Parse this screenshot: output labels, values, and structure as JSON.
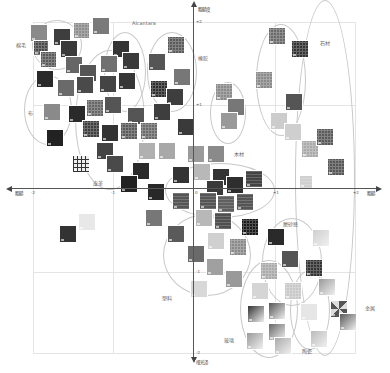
{
  "figure": {
    "title_label": "Alcantara",
    "axes": {
      "x_left_label": "粗糙",
      "x_right_label": "粗糙",
      "y_top_label": "粗糙度",
      "y_bottom_label": "哑光泽",
      "x_ticks": [
        "-2",
        "-1",
        "0",
        "+1",
        "+2"
      ],
      "y_ticks": [
        "+2",
        "+1",
        "-1",
        "-2"
      ]
    },
    "categories": [
      {
        "name": "棉毛",
        "x": 18,
        "y": 45
      },
      {
        "name": "布",
        "x": 28,
        "y": 112
      },
      {
        "name": "皮革",
        "x": 92,
        "y": 180
      },
      {
        "name": "橡胶",
        "x": 200,
        "y": 55
      },
      {
        "name": "木材",
        "x": 236,
        "y": 152
      },
      {
        "name": "石材",
        "x": 320,
        "y": 42
      },
      {
        "name": "磨砂感",
        "x": 283,
        "y": 222
      },
      {
        "name": "塑料",
        "x": 163,
        "y": 296
      },
      {
        "name": "玻璃",
        "x": 223,
        "y": 337
      },
      {
        "name": "陶瓷",
        "x": 302,
        "y": 348
      },
      {
        "name": "金属",
        "x": 365,
        "y": 305
      }
    ]
  },
  "chart_data": {
    "type": "scatter",
    "xlabel": "粗糙 ← → 粗糙",
    "ylabel": "粗糙度 (top) / 哑光泽 (bottom)",
    "xlim": [
      -2,
      2
    ],
    "ylim": [
      -2,
      2
    ],
    "x_ticks": [
      -2,
      -1,
      0,
      1,
      2
    ],
    "y_ticks": [
      -2,
      -1,
      1,
      2
    ],
    "grid": true,
    "annotation": "Alcantara",
    "groups": [
      {
        "name": "棉毛",
        "points": [
          [
            -1.7,
            1.8
          ],
          [
            -1.2,
            1.7
          ],
          [
            -0.9,
            1.85
          ],
          [
            -1.8,
            1.5
          ],
          [
            -1.7,
            1.4
          ]
        ]
      },
      {
        "name": "布",
        "points": [
          [
            -1.9,
            1.2
          ],
          [
            -1.5,
            0.5
          ],
          [
            -1.6,
            0.1
          ]
        ]
      },
      {
        "name": "皮革",
        "points": [
          [
            -1.3,
            1.0
          ],
          [
            -1.1,
            0.9
          ],
          [
            -0.8,
            0.6
          ],
          [
            -1.0,
            0.3
          ],
          [
            -0.6,
            0.3
          ],
          [
            -0.6,
            -0.0
          ],
          [
            -0.7,
            -0.1
          ]
        ]
      },
      {
        "name": "橡胶",
        "points": [
          [
            -0.6,
            1.6
          ],
          [
            -0.4,
            1.4
          ],
          [
            -0.3,
            0.9
          ],
          [
            -0.6,
            0.6
          ],
          [
            -0.2,
            0.6
          ]
        ]
      },
      {
        "name": "木材",
        "points": [
          [
            0.0,
            0.3
          ],
          [
            0.3,
            0.0
          ],
          [
            0.55,
            -0.05
          ],
          [
            0.5,
            0.2
          ],
          [
            0.3,
            0.2
          ]
        ]
      },
      {
        "name": "石材",
        "points": [
          [
            1.0,
            1.8
          ],
          [
            1.3,
            1.6
          ],
          [
            0.8,
            1.2
          ],
          [
            1.2,
            0.8
          ],
          [
            1.0,
            0.5
          ],
          [
            1.2,
            0.4
          ]
        ]
      },
      {
        "name": "磨砂感",
        "points": [
          [
            0.6,
            -0.4
          ],
          [
            0.9,
            -0.5
          ],
          [
            1.1,
            -0.8
          ],
          [
            0.2,
            -0.6
          ]
        ]
      },
      {
        "name": "塑料",
        "points": [
          [
            -0.2,
            -0.2
          ],
          [
            -0.1,
            -0.45
          ],
          [
            0.0,
            -0.9
          ],
          [
            0.2,
            -1.0
          ],
          [
            -0.1,
            -1.2
          ]
        ]
      },
      {
        "name": "玻璃",
        "points": [
          [
            0.85,
            -1.0
          ],
          [
            0.7,
            -1.2
          ],
          [
            0.75,
            -1.55
          ],
          [
            0.9,
            -1.5
          ],
          [
            0.75,
            -1.8
          ],
          [
            0.95,
            -1.85
          ]
        ]
      },
      {
        "name": "陶瓷",
        "points": [
          [
            1.1,
            -1.15
          ],
          [
            1.2,
            -1.45
          ],
          [
            1.25,
            -1.75
          ]
        ]
      },
      {
        "name": "金属",
        "points": [
          [
            1.5,
            -0.35
          ],
          [
            1.45,
            -0.9
          ],
          [
            1.6,
            -1.15
          ],
          [
            1.7,
            -1.4
          ],
          [
            1.6,
            -1.55
          ]
        ]
      },
      {
        "name": "outliers",
        "points": [
          [
            -1.55,
            -0.45
          ],
          [
            -1.35,
            -0.35
          ]
        ]
      }
    ]
  },
  "swatches": [
    {
      "x": 30,
      "y": 24,
      "s": 18,
      "c": "#8a8a8a"
    },
    {
      "x": 53,
      "y": 28,
      "s": 18,
      "c": "#3e3e3e"
    },
    {
      "x": 73,
      "y": 22,
      "s": 17,
      "c": "#8c8c8c",
      "p": "dots"
    },
    {
      "x": 92,
      "y": 17,
      "s": 18,
      "c": "#7a7a7a"
    },
    {
      "x": 33,
      "y": 40,
      "s": 16,
      "c": "#4a4a4a",
      "p": "dots"
    },
    {
      "x": 40,
      "y": 51,
      "s": 17,
      "c": "#5a5a5a",
      "p": "dots"
    },
    {
      "x": 60,
      "y": 40,
      "s": 18,
      "c": "#3a3a3a"
    },
    {
      "x": 112,
      "y": 40,
      "s": 18,
      "c": "#353535"
    },
    {
      "x": 122,
      "y": 52,
      "s": 18,
      "c": "#3a3a3a"
    },
    {
      "x": 100,
      "y": 55,
      "s": 18,
      "c": "#707070"
    },
    {
      "x": 148,
      "y": 53,
      "s": 18,
      "c": "#555555"
    },
    {
      "x": 167,
      "y": 36,
      "s": 18,
      "c": "#5a5a5a",
      "p": "dots"
    },
    {
      "x": 65,
      "y": 56,
      "s": 18,
      "c": "#666666"
    },
    {
      "x": 79,
      "y": 64,
      "s": 18,
      "c": "#555555"
    },
    {
      "x": 36,
      "y": 70,
      "s": 18,
      "c": "#2a2a2a"
    },
    {
      "x": 57,
      "y": 79,
      "s": 18,
      "c": "#6a6a6a"
    },
    {
      "x": 76,
      "y": 76,
      "s": 18,
      "c": "#4a4a4a"
    },
    {
      "x": 99,
      "y": 75,
      "s": 18,
      "c": "#444444"
    },
    {
      "x": 118,
      "y": 72,
      "s": 18,
      "c": "#363636"
    },
    {
      "x": 150,
      "y": 80,
      "s": 18,
      "c": "#2e2e2e",
      "p": "dots"
    },
    {
      "x": 166,
      "y": 88,
      "s": 18,
      "c": "#3e3e3e"
    },
    {
      "x": 173,
      "y": 68,
      "s": 18,
      "c": "#777777"
    },
    {
      "x": 43,
      "y": 103,
      "s": 18,
      "c": "#8a8a8a"
    },
    {
      "x": 68,
      "y": 105,
      "s": 18,
      "c": "#2a2a2a"
    },
    {
      "x": 86,
      "y": 99,
      "s": 18,
      "c": "#666666",
      "p": "dots"
    },
    {
      "x": 104,
      "y": 96,
      "s": 18,
      "c": "#555555"
    },
    {
      "x": 127,
      "y": 107,
      "s": 18,
      "c": "#555555"
    },
    {
      "x": 153,
      "y": 103,
      "s": 18,
      "c": "#3e3e3e"
    },
    {
      "x": 177,
      "y": 118,
      "s": 18,
      "c": "#3a3a3a"
    },
    {
      "x": 82,
      "y": 120,
      "s": 18,
      "c": "#3e3e3e",
      "p": "dots"
    },
    {
      "x": 101,
      "y": 124,
      "s": 18,
      "c": "#333333"
    },
    {
      "x": 120,
      "y": 122,
      "s": 18,
      "c": "#5a5a5a",
      "p": "dots"
    },
    {
      "x": 140,
      "y": 122,
      "s": 18,
      "c": "#6a6a6a",
      "p": "dots"
    },
    {
      "x": 46,
      "y": 129,
      "s": 18,
      "c": "#222222"
    },
    {
      "x": 96,
      "y": 142,
      "s": 18,
      "c": "#444444"
    },
    {
      "x": 106,
      "y": 155,
      "s": 18,
      "c": "#4a4a4a"
    },
    {
      "x": 138,
      "y": 142,
      "s": 18,
      "c": "#b0b0b0"
    },
    {
      "x": 158,
      "y": 142,
      "s": 18,
      "c": "#a8a8a8"
    },
    {
      "x": 187,
      "y": 145,
      "s": 18,
      "c": "#9a9a9a"
    },
    {
      "x": 207,
      "y": 145,
      "s": 18,
      "c": "#8a8a8a"
    },
    {
      "x": 215,
      "y": 83,
      "s": 18,
      "c": "#8a8a8a",
      "p": "dots"
    },
    {
      "x": 227,
      "y": 98,
      "s": 18,
      "c": "#777777"
    },
    {
      "x": 220,
      "y": 112,
      "s": 18,
      "c": "#999999"
    },
    {
      "x": 72,
      "y": 155,
      "s": 18,
      "c": "#ffffff",
      "p": "plaid"
    },
    {
      "x": 132,
      "y": 162,
      "s": 18,
      "c": "#2a2a2a"
    },
    {
      "x": 120,
      "y": 175,
      "s": 18,
      "c": "#222222"
    },
    {
      "x": 147,
      "y": 183,
      "s": 18,
      "c": "#282828"
    },
    {
      "x": 172,
      "y": 166,
      "s": 18,
      "c": "#333333"
    },
    {
      "x": 193,
      "y": 163,
      "s": 18,
      "c": "#b8b8b8"
    },
    {
      "x": 212,
      "y": 168,
      "s": 18,
      "c": "#333333"
    },
    {
      "x": 226,
      "y": 176,
      "s": 18,
      "c": "#2e2e2e"
    },
    {
      "x": 245,
      "y": 170,
      "s": 18,
      "c": "#444444",
      "p": "stripes"
    },
    {
      "x": 206,
      "y": 180,
      "s": 18,
      "c": "#3a3a3a"
    },
    {
      "x": 172,
      "y": 192,
      "s": 18,
      "c": "#555555",
      "p": "stripes"
    },
    {
      "x": 199,
      "y": 192,
      "s": 18,
      "c": "#555555",
      "p": "stripes"
    },
    {
      "x": 217,
      "y": 195,
      "s": 18,
      "c": "#606060",
      "p": "stripes"
    },
    {
      "x": 236,
      "y": 193,
      "s": 18,
      "c": "#555555",
      "p": "stripes"
    },
    {
      "x": 214,
      "y": 212,
      "s": 18,
      "c": "#505050",
      "p": "stripes"
    },
    {
      "x": 195,
      "y": 209,
      "s": 18,
      "c": "#b8b8b8"
    },
    {
      "x": 145,
      "y": 209,
      "s": 18,
      "c": "#777777"
    },
    {
      "x": 167,
      "y": 225,
      "s": 18,
      "c": "#5a5a5a"
    },
    {
      "x": 207,
      "y": 232,
      "s": 18,
      "c": "#d0d0d0"
    },
    {
      "x": 241,
      "y": 218,
      "s": 18,
      "c": "#1a1a1a",
      "p": "dots"
    },
    {
      "x": 229,
      "y": 238,
      "s": 18,
      "c": "#8a8a8a",
      "p": "dots"
    },
    {
      "x": 267,
      "y": 228,
      "s": 18,
      "c": "#2a2a2a"
    },
    {
      "x": 281,
      "y": 250,
      "s": 18,
      "c": "#555555"
    },
    {
      "x": 312,
      "y": 229,
      "s": 18,
      "c": "#cfcfcf",
      "p": "grad"
    },
    {
      "x": 305,
      "y": 259,
      "s": 18,
      "c": "#333333",
      "p": "dots"
    },
    {
      "x": 187,
      "y": 245,
      "s": 18,
      "c": "#6a6a6a"
    },
    {
      "x": 206,
      "y": 258,
      "s": 18,
      "c": "#a0a0a0"
    },
    {
      "x": 225,
      "y": 270,
      "s": 18,
      "c": "#999999"
    },
    {
      "x": 190,
      "y": 280,
      "s": 18,
      "c": "#d8d8d8"
    },
    {
      "x": 260,
      "y": 262,
      "s": 18,
      "c": "#aaaaaa",
      "p": "dots"
    },
    {
      "x": 251,
      "y": 282,
      "s": 18,
      "c": "#d5d5d5"
    },
    {
      "x": 284,
      "y": 282,
      "s": 18,
      "c": "#c8c8c8",
      "p": "dots"
    },
    {
      "x": 318,
      "y": 278,
      "s": 18,
      "c": "#999999",
      "p": "grad"
    },
    {
      "x": 247,
      "y": 305,
      "s": 18,
      "c": "#333333",
      "p": "grad"
    },
    {
      "x": 268,
      "y": 302,
      "s": 18,
      "c": "#555555",
      "p": "grad"
    },
    {
      "x": 300,
      "y": 303,
      "s": 18,
      "c": "#e6e6e6"
    },
    {
      "x": 330,
      "y": 300,
      "s": 18,
      "c": "#aaaaaa",
      "p": "cross"
    },
    {
      "x": 339,
      "y": 313,
      "s": 18,
      "c": "#5a5a5a",
      "p": "grad"
    },
    {
      "x": 268,
      "y": 323,
      "s": 18,
      "c": "#666666",
      "p": "grad"
    },
    {
      "x": 246,
      "y": 332,
      "s": 18,
      "c": "#999999",
      "p": "grad"
    },
    {
      "x": 274,
      "y": 337,
      "s": 18,
      "c": "#aaaaaa",
      "p": "grad"
    },
    {
      "x": 310,
      "y": 330,
      "s": 18,
      "c": "#bbbbbb",
      "p": "grad"
    },
    {
      "x": 59,
      "y": 225,
      "s": 18,
      "c": "#333333"
    },
    {
      "x": 78,
      "y": 213,
      "s": 18,
      "c": "#e8e8e8"
    },
    {
      "x": 301,
      "y": 140,
      "s": 18,
      "c": "#aaaaaa",
      "p": "dots"
    },
    {
      "x": 316,
      "y": 128,
      "s": 18,
      "c": "#5a5a5a",
      "p": "dots"
    },
    {
      "x": 327,
      "y": 158,
      "s": 18,
      "c": "#555555",
      "p": "dots"
    },
    {
      "x": 299,
      "y": 175,
      "s": 14,
      "c": "#d0d0d0",
      "p": "stripes"
    },
    {
      "x": 268,
      "y": 27,
      "s": 18,
      "c": "#6a6a6a",
      "p": "dots"
    },
    {
      "x": 291,
      "y": 40,
      "s": 18,
      "c": "#333333",
      "p": "dots"
    },
    {
      "x": 255,
      "y": 71,
      "s": 18,
      "c": "#8a8a8a",
      "p": "dots"
    },
    {
      "x": 285,
      "y": 93,
      "s": 18,
      "c": "#555555"
    },
    {
      "x": 270,
      "y": 112,
      "s": 18,
      "c": "#cccccc"
    },
    {
      "x": 284,
      "y": 123,
      "s": 18,
      "c": "#cfcfcf"
    },
    {
      "x": 167,
      "y": 13,
      "s": 0,
      "c": "#ffffff"
    }
  ],
  "ellipses": [
    {
      "x": 32,
      "y": 20,
      "w": 50,
      "h": 50
    },
    {
      "x": 24,
      "y": 75,
      "w": 48,
      "h": 70
    },
    {
      "x": 75,
      "y": 50,
      "w": 70,
      "h": 140
    },
    {
      "x": 104,
      "y": 32,
      "w": 42,
      "h": 80
    },
    {
      "x": 147,
      "y": 32,
      "w": 50,
      "h": 80
    },
    {
      "x": 210,
      "y": 82,
      "w": 36,
      "h": 62
    },
    {
      "x": 256,
      "y": 24,
      "w": 50,
      "h": 112
    },
    {
      "x": 165,
      "y": 163,
      "w": 110,
      "h": 55
    },
    {
      "x": 163,
      "y": 214,
      "w": 88,
      "h": 82
    },
    {
      "x": 262,
      "y": 218,
      "w": 60,
      "h": 88
    },
    {
      "x": 240,
      "y": 260,
      "w": 58,
      "h": 98
    },
    {
      "x": 290,
      "y": 270,
      "w": 40,
      "h": 80
    },
    {
      "x": 295,
      "y": 0,
      "w": 60,
      "h": 356
    }
  ]
}
